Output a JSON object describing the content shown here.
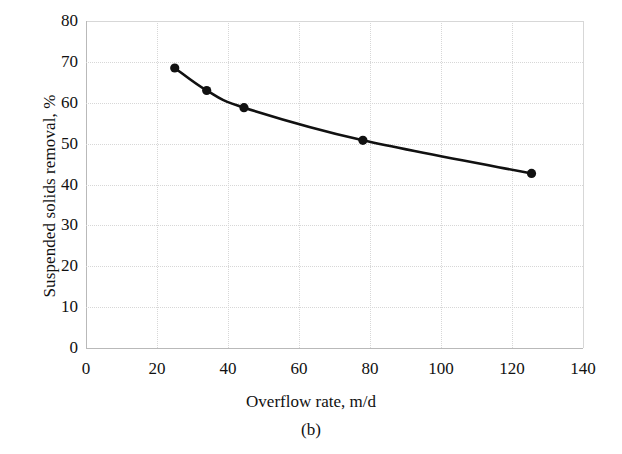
{
  "chart_data": {
    "type": "line",
    "title": "",
    "caption": "(b)",
    "xlabel": "Overflow rate, m/d",
    "ylabel": "Suspended solids removal, %",
    "xlim": [
      0,
      140
    ],
    "ylim": [
      0,
      80
    ],
    "xticks": [
      0,
      20,
      40,
      60,
      80,
      100,
      120,
      140
    ],
    "yticks": [
      0,
      10,
      20,
      30,
      40,
      50,
      60,
      70,
      80
    ],
    "grid": true,
    "legend": "none",
    "marker": "filled-circle",
    "line_color": "#111111",
    "marker_color": "#111111",
    "grid_color": "#d7d7d7",
    "series": [
      {
        "name": "Suspended solids removal",
        "x": [
          25,
          34,
          44.5,
          78,
          125.5
        ],
        "y": [
          68.5,
          63.0,
          58.8,
          50.8,
          42.7
        ]
      }
    ]
  },
  "axis": {
    "x_tick_labels": [
      "0",
      "20",
      "40",
      "60",
      "80",
      "100",
      "120",
      "140"
    ],
    "y_tick_labels": [
      "0",
      "10",
      "20",
      "30",
      "40",
      "50",
      "60",
      "70",
      "80"
    ]
  }
}
